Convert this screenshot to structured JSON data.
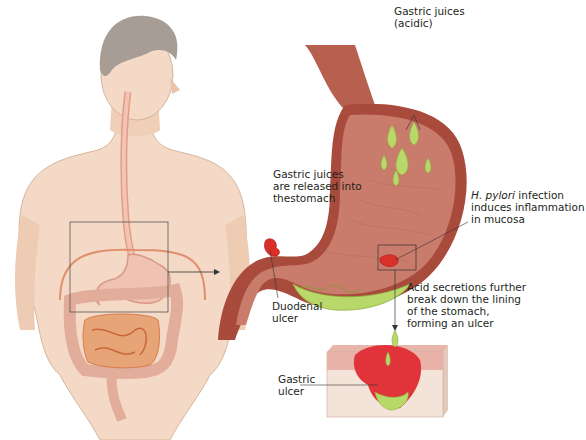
{
  "figure": {
    "body_view": {
      "description": "Human torso showing digestive tract with inset box around stomach"
    },
    "labels": {
      "gastric_juices_acidic": "Gastric juices\n(acidic)",
      "gastric_juices_released": "Gastric juices\nare released into\nthestomach",
      "h_pylori_italic": "H. pylori",
      "h_pylori_rest": " infection\ninduces inflammation\nin mucosa",
      "acid_secretions": "Acid secretions further\nbreak down the lining\nof the stomach,\nforming an ulcer",
      "duodenal_ulcer": "Duodenal\nulcer",
      "gastric_ulcer": "Gastric\nulcer"
    },
    "colors": {
      "skin": "#f3d9c6",
      "skin_shadow": "#e2b9a0",
      "hair": "#a79d95",
      "stomach_wall": "#b45a4a",
      "stomach_inner": "#c7786a",
      "acid": "#b8d86a",
      "ulcer": "#d9302a",
      "intestine": "#e8b6a6",
      "small_intestine": "#e0945f"
    }
  }
}
